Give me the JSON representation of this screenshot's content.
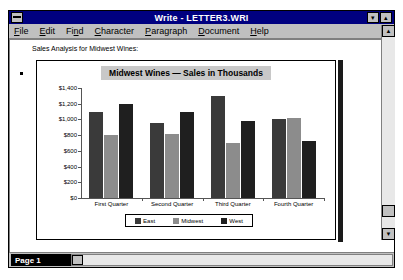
{
  "window": {
    "title": "Write - LETTER3.WRI",
    "system_menu_icon": "system-menu-icon",
    "minimize_label": "▾",
    "maximize_label": "▴"
  },
  "menubar": {
    "items": [
      {
        "pre": "",
        "accel": "F",
        "post": "ile"
      },
      {
        "pre": "",
        "accel": "E",
        "post": "dit"
      },
      {
        "pre": "Fi",
        "accel": "n",
        "post": "d"
      },
      {
        "pre": "",
        "accel": "C",
        "post": "haracter"
      },
      {
        "pre": "",
        "accel": "P",
        "post": "aragraph"
      },
      {
        "pre": "",
        "accel": "D",
        "post": "ocument"
      },
      {
        "pre": "",
        "accel": "H",
        "post": "elp"
      }
    ]
  },
  "document": {
    "body_text": "Sales Analysis for Midwest Wines:"
  },
  "statusbar": {
    "page_label": "Page 1"
  },
  "scrollbar": {
    "up_arrow": "▲",
    "down_arrow": "▼",
    "left_arrow": "◄"
  },
  "chart_data": {
    "type": "bar",
    "title": "Midwest Wines — Sales in Thousands",
    "categories": [
      "First Quarter",
      "Second Quarter",
      "Third Quarter",
      "Fourth Quarter"
    ],
    "series": [
      {
        "name": "East",
        "color": "#3a3a3a",
        "values": [
          1100,
          950,
          1300,
          1000
        ]
      },
      {
        "name": "Midwest",
        "color": "#8c8c8c",
        "values": [
          800,
          820,
          700,
          1020
        ]
      },
      {
        "name": "West",
        "color": "#1f1f1f",
        "values": [
          1200,
          1100,
          980,
          720
        ]
      }
    ],
    "ylabel": "",
    "xlabel": "",
    "ylim": [
      0,
      1400
    ],
    "yticks": [
      "$1,400",
      "$1,200",
      "$1,000",
      "$800",
      "$600",
      "$400",
      "$200",
      "$0"
    ],
    "ytick_values": [
      1400,
      1200,
      1000,
      800,
      600,
      400,
      200,
      0
    ],
    "grid": false,
    "legend_position": "bottom"
  }
}
